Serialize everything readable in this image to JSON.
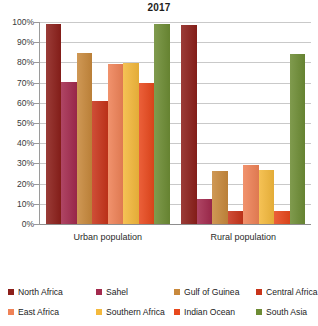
{
  "chart_data": {
    "type": "bar",
    "title": "2017",
    "xlabel": "",
    "ylabel": "",
    "ylim": [
      0,
      100
    ],
    "grid": true,
    "legend_position": "bottom",
    "categories": [
      "Urban population",
      "Rural population"
    ],
    "ytick_labels": [
      "100%",
      "90%",
      "80%",
      "70%",
      "60%",
      "50%",
      "40%",
      "30%",
      "20%",
      "10%",
      "0%"
    ],
    "ytick_values": [
      100,
      90,
      80,
      70,
      60,
      50,
      40,
      30,
      20,
      10,
      0
    ],
    "series": [
      {
        "name": "North Africa",
        "color": "#8c1f1a",
        "values": [
          99.0,
          98.5
        ]
      },
      {
        "name": "Sahel",
        "color": "#a32a4e",
        "values": [
          70.5,
          12.5
        ]
      },
      {
        "name": "Gulf of Guinea",
        "color": "#c8893c",
        "values": [
          84.5,
          26.0
        ]
      },
      {
        "name": "Central Africa",
        "color": "#c8341a",
        "values": [
          61.0,
          6.5
        ]
      },
      {
        "name": "East Africa",
        "color": "#ef8257",
        "values": [
          79.0,
          29.0
        ]
      },
      {
        "name": "Southern Africa",
        "color": "#f4b93c",
        "values": [
          79.5,
          26.5
        ]
      },
      {
        "name": "Indian Ocean",
        "color": "#e8481c",
        "values": [
          70.0,
          6.5
        ]
      },
      {
        "name": "South Asia",
        "color": "#6d8c34",
        "values": [
          99.0,
          84.0
        ]
      }
    ]
  }
}
